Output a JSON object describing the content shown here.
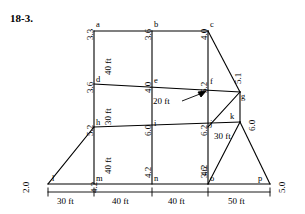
{
  "problem": {
    "number": "18-3."
  },
  "diagram": {
    "type": "structural-truss",
    "units": "ft",
    "nodes": [
      {
        "id": "a",
        "label": "a",
        "load": "3.3",
        "x": 94,
        "y": 31
      },
      {
        "id": "b",
        "label": "b",
        "load": "3.6",
        "x": 152,
        "y": 31
      },
      {
        "id": "c",
        "label": "c",
        "load": "4.0",
        "x": 208,
        "y": 31
      },
      {
        "id": "d",
        "label": "d",
        "load": "3.6",
        "x": 94,
        "y": 84
      },
      {
        "id": "e",
        "label": "e",
        "load": "4.0",
        "x": 152,
        "y": 84
      },
      {
        "id": "f",
        "label": "f",
        "load": "5.2",
        "x": 208,
        "y": 84
      },
      {
        "id": "g",
        "label": "g",
        "load": "5.1",
        "x": 240,
        "y": 92
      },
      {
        "id": "h",
        "label": "h",
        "load": "5.2",
        "x": 94,
        "y": 127
      },
      {
        "id": "i",
        "label": "i",
        "load": "6.0",
        "x": 152,
        "y": 127
      },
      {
        "id": "j",
        "label": "j",
        "load": "6.2",
        "x": 208,
        "y": 127
      },
      {
        "id": "k",
        "label": "k",
        "load": "6.0",
        "x": 240,
        "y": 122
      },
      {
        "id": "l",
        "label": "l",
        "load": "2.0",
        "x": 48,
        "y": 184
      },
      {
        "id": "m",
        "label": "m",
        "load": "4.2",
        "x": 94,
        "y": 184
      },
      {
        "id": "n",
        "label": "n",
        "load": "4.2",
        "x": 152,
        "y": 184
      },
      {
        "id": "o",
        "label": "o",
        "load": "3.6",
        "x": 208,
        "y": 184
      },
      {
        "id": "p",
        "label": "p",
        "load": "5.0",
        "x": 270,
        "y": 184
      }
    ],
    "interior_dimensions": [
      {
        "text": "40 ft",
        "between": "a-d"
      },
      {
        "text": "30 ft",
        "between": "d-h"
      },
      {
        "text": "40 ft",
        "between": "h-m"
      },
      {
        "text": "30 ft",
        "between": "j-k"
      },
      {
        "text": "20 ft",
        "between": "f-g",
        "callout": true
      }
    ],
    "bottom_dimensions": [
      {
        "text": "30 ft",
        "span": "l-m"
      },
      {
        "text": "40 ft",
        "span": "m-n"
      },
      {
        "text": "40 ft",
        "span": "n-o"
      },
      {
        "text": "50 ft",
        "span": "o-p"
      }
    ],
    "load_values": {
      "a": "3.3",
      "b": "3.6",
      "c": "4.0",
      "d": "3.6",
      "e": "4.0",
      "f": "5.2",
      "g": "5.1",
      "h": "5.2",
      "i": "6.0",
      "j": "6.2",
      "k": "6.0",
      "l": "2.0",
      "m": "4.2",
      "n": "4.2",
      "o": "3.6",
      "p": "5.0"
    },
    "colors": {
      "line": "#000000",
      "background": "#ffffff",
      "text": "#000000"
    }
  }
}
